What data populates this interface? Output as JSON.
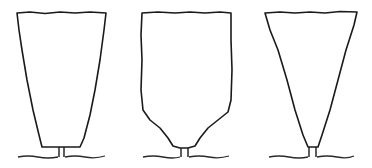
{
  "figure": {
    "stroke_color": "#1a1a1a",
    "background": "#ffffff",
    "shapes": [
      {
        "name": "trapezoid-hedge",
        "shape": "wide top tapering to flat narrow bottom"
      },
      {
        "name": "rounded-base-hedge",
        "shape": "straight sides curving inward to trunk"
      },
      {
        "name": "inverted-triangle-hedge",
        "shape": "wide top tapering to a point at trunk"
      }
    ]
  }
}
